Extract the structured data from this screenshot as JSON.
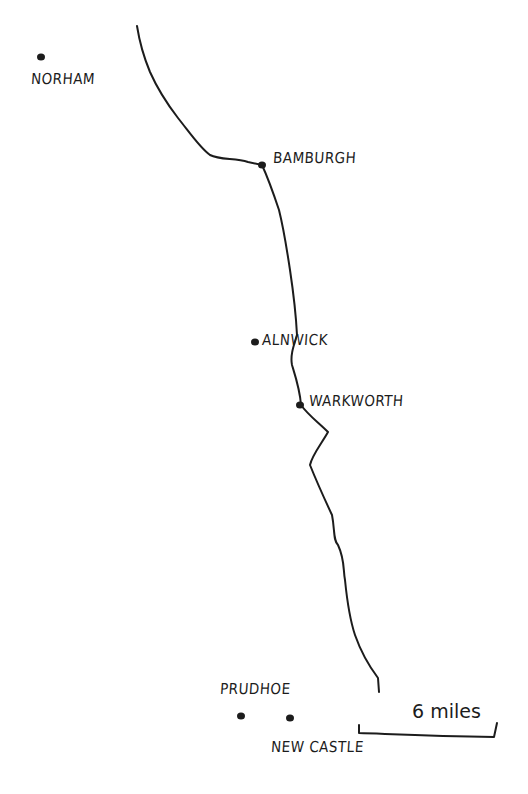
{
  "map": {
    "title": "",
    "ink_color": "#1c1c1c",
    "background": "#ffffff",
    "coastline": "M137,26 C140,45 145,60 150,72 C158,90 168,105 178,118 C190,133 200,148 210,155 C220,160 235,158 248,162 L262,165 C268,178 274,195 279,210 C284,230 287,250 290,270 C293,290 296,315 297,335 C294,345 290,355 292,365 C296,378 300,390 301,405 C308,415 318,422 328,432 C322,443 312,455 310,465 C318,485 325,500 332,515 C335,530 333,540 338,545 C345,560 343,570 345,580 C347,600 350,620 355,635 C362,655 372,670 378,678 L379,692",
    "places": [
      {
        "name": "NORHAM",
        "dot": [
          41,
          57
        ],
        "label_pos": [
          31,
          70
        ]
      },
      {
        "name": "BAMBURGH",
        "dot": [
          262,
          165
        ],
        "label_pos": [
          273,
          149
        ]
      },
      {
        "name": "ALNWICK",
        "dot": [
          255,
          342
        ],
        "label_pos": [
          262,
          331
        ]
      },
      {
        "name": "WARKWORTH",
        "dot": [
          300,
          405
        ],
        "label_pos": [
          309,
          392
        ]
      },
      {
        "name": "PRUDHOE",
        "dot": [
          241,
          716
        ],
        "label_pos": [
          220,
          680
        ]
      },
      {
        "name": "NEW CASTLE",
        "dot": [
          290,
          718
        ],
        "label_pos": [
          271,
          738
        ]
      }
    ],
    "scale_bar": {
      "label": "6 miles",
      "path": "M359,725 L359,733 C390,734 430,736 494,737 L497,723",
      "label_pos": [
        412,
        700
      ]
    }
  }
}
